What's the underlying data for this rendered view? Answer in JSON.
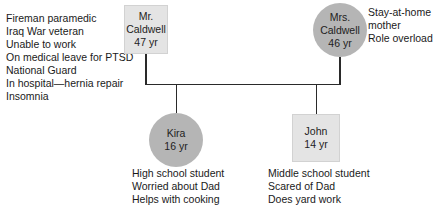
{
  "colors": {
    "male_fill": "#e4e4e4",
    "female_fill": "#b5b5b5",
    "line": "#2a2a2a"
  },
  "father": {
    "name_line1": "Mr.",
    "name_line2": "Caldwell",
    "age": "47 yr",
    "shape": "square",
    "notes": [
      "Fireman paramedic",
      "Iraq War veteran",
      "Unable to work",
      "On medical leave for PTSD",
      "National Guard",
      "In hospital—hernia repair",
      "Insomnia"
    ]
  },
  "mother": {
    "name_line1": "Mrs.",
    "name_line2": "Caldwell",
    "age": "46 yr",
    "shape": "circle",
    "notes": [
      "Stay-at-home",
      "mother",
      "Role overload"
    ]
  },
  "children": [
    {
      "name": "Kira",
      "age": "16 yr",
      "shape": "circle",
      "notes": [
        "High school student",
        "Worried about Dad",
        "Helps with cooking"
      ]
    },
    {
      "name": "John",
      "age": "14 yr",
      "shape": "square",
      "notes": [
        "Middle school student",
        "Scared of Dad",
        "Does yard work"
      ]
    }
  ]
}
